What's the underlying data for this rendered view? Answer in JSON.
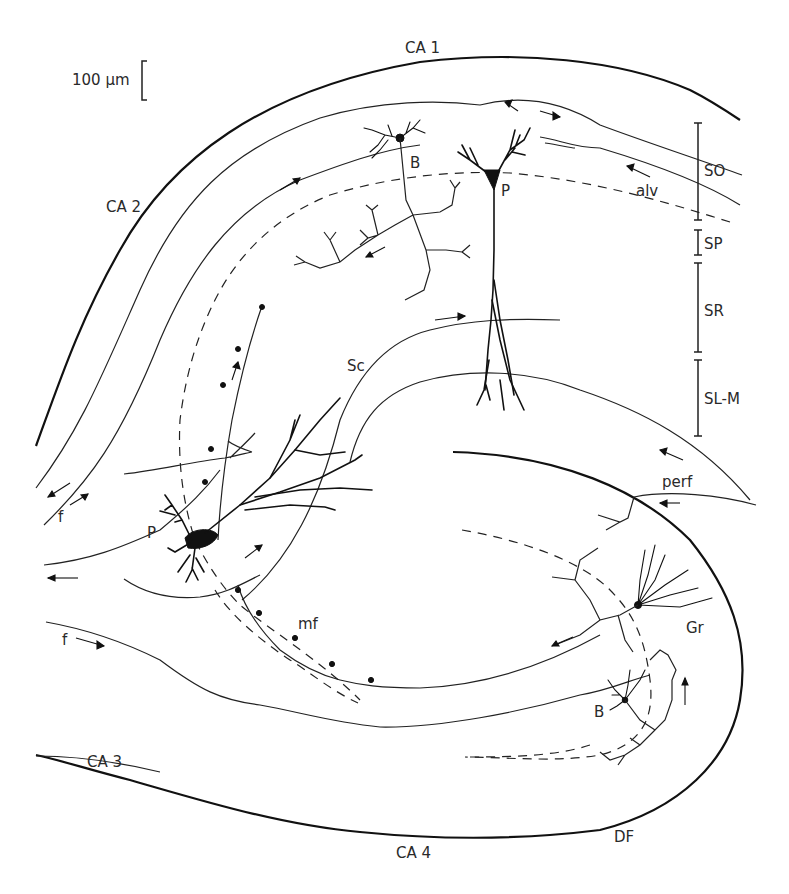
{
  "figure": {
    "scale_bar": {
      "label": "100 µm",
      "length_um": 100
    },
    "region_labels": {
      "ca1": "CA 1",
      "ca2": "CA 2",
      "ca3": "CA 3",
      "ca4": "CA 4",
      "df": "DF"
    },
    "layer_labels": [
      {
        "id": "so",
        "label": "SO"
      },
      {
        "id": "sp",
        "label": "SP"
      },
      {
        "id": "sr",
        "label": "SR"
      },
      {
        "id": "slm",
        "label": "SL-M"
      }
    ],
    "pathway_labels": {
      "alveus": "alv",
      "schaffer_collateral": "Sc",
      "fimbria_upper": "f",
      "fimbria_lower": "f",
      "mossy_fibers": "mf",
      "perforant_path": "perf"
    },
    "cell_labels": {
      "ca1_pyramidal": "P",
      "ca1_basket": "B",
      "ca3_pyramidal": "P",
      "granule": "Gr",
      "dentate_basket": "B"
    }
  }
}
